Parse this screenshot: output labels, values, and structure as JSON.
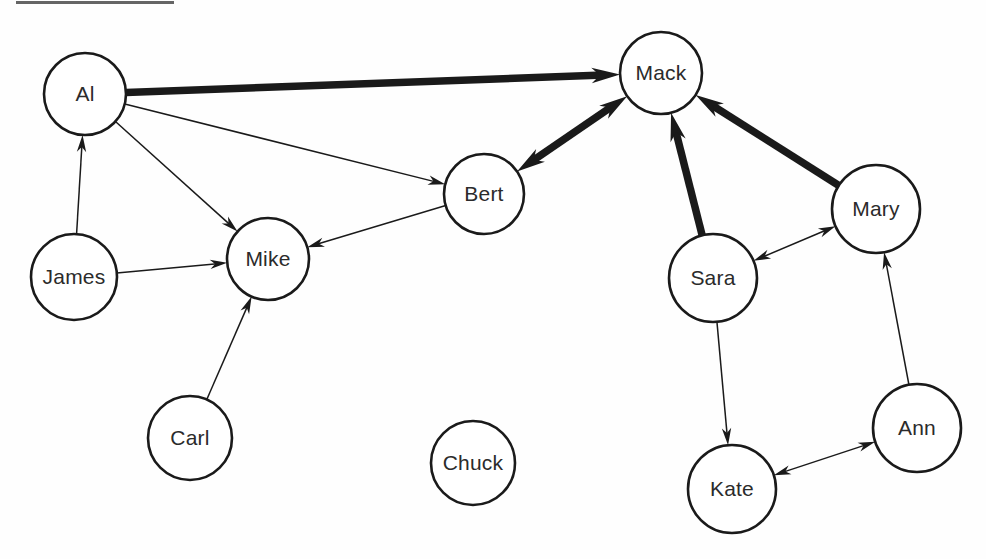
{
  "diagram": {
    "type": "directed-social-network-graph",
    "title": "",
    "width": 986,
    "height": 559,
    "background_color": "#fefefe",
    "node_fill_color": "#ffffff",
    "node_stroke_color": "#1a1a1a",
    "label_color": "#2b2b2b",
    "edge_color": "#1a1a1a",
    "thin_edge_width": 1.5,
    "thick_edge_width": 7.5
  },
  "artifact": {
    "name": "scan-edge-mark",
    "x": 16,
    "y": 1,
    "width": 158,
    "height": 3,
    "color": "#4a4a4a"
  },
  "nodes": [
    {
      "id": "al",
      "label": "Al",
      "cx": 85,
      "cy": 94,
      "r": 41
    },
    {
      "id": "mack",
      "label": "Mack",
      "cx": 661,
      "cy": 73,
      "r": 41
    },
    {
      "id": "bert",
      "label": "Bert",
      "cx": 484,
      "cy": 194,
      "r": 40
    },
    {
      "id": "mary",
      "label": "Mary",
      "cx": 876,
      "cy": 209,
      "r": 44
    },
    {
      "id": "mike",
      "label": "Mike",
      "cx": 268,
      "cy": 259,
      "r": 41
    },
    {
      "id": "james",
      "label": "James",
      "cx": 74,
      "cy": 277,
      "r": 43
    },
    {
      "id": "sara",
      "label": "Sara",
      "cx": 713,
      "cy": 278,
      "r": 44
    },
    {
      "id": "ann",
      "label": "Ann",
      "cx": 917,
      "cy": 428,
      "r": 44
    },
    {
      "id": "carl",
      "label": "Carl",
      "cx": 190,
      "cy": 438,
      "r": 42
    },
    {
      "id": "chuck",
      "label": "Chuck",
      "cx": 473,
      "cy": 463,
      "r": 42
    },
    {
      "id": "kate",
      "label": "Kate",
      "cx": 732,
      "cy": 489,
      "r": 44
    }
  ],
  "edges": [
    {
      "id": "al-mack",
      "from": "al",
      "to": "mack",
      "weight": "thick",
      "direction": "forward",
      "arrow_size": 15
    },
    {
      "id": "al-bert",
      "from": "al",
      "to": "bert",
      "weight": "thin",
      "direction": "forward",
      "arrow_size": 9
    },
    {
      "id": "al-mike",
      "from": "al",
      "to": "mike",
      "weight": "thin",
      "direction": "forward",
      "arrow_size": 9
    },
    {
      "id": "james-al",
      "from": "james",
      "to": "al",
      "weight": "thin",
      "direction": "forward",
      "arrow_size": 9
    },
    {
      "id": "james-mike",
      "from": "james",
      "to": "mike",
      "weight": "thin",
      "direction": "forward",
      "arrow_size": 9
    },
    {
      "id": "carl-mike",
      "from": "carl",
      "to": "mike",
      "weight": "thin",
      "direction": "forward",
      "arrow_size": 9
    },
    {
      "id": "bert-mike",
      "from": "bert",
      "to": "mike",
      "weight": "thin",
      "direction": "forward",
      "arrow_size": 9
    },
    {
      "id": "bert-mack",
      "from": "bert",
      "to": "mack",
      "weight": "thick",
      "direction": "bidirectional",
      "arrow_size": 15
    },
    {
      "id": "sara-mack",
      "from": "sara",
      "to": "mack",
      "weight": "thick",
      "direction": "forward",
      "arrow_size": 15
    },
    {
      "id": "mary-mack",
      "from": "mary",
      "to": "mack",
      "weight": "thick",
      "direction": "forward",
      "arrow_size": 15
    },
    {
      "id": "sara-mary",
      "from": "sara",
      "to": "mary",
      "weight": "thin",
      "direction": "bidirectional",
      "arrow_size": 9
    },
    {
      "id": "sara-kate",
      "from": "sara",
      "to": "kate",
      "weight": "thin",
      "direction": "forward",
      "arrow_size": 9
    },
    {
      "id": "kate-ann",
      "from": "kate",
      "to": "ann",
      "weight": "thin",
      "direction": "bidirectional",
      "arrow_size": 9
    },
    {
      "id": "ann-mary",
      "from": "ann",
      "to": "mary",
      "weight": "thin",
      "direction": "forward",
      "arrow_size": 9
    }
  ]
}
